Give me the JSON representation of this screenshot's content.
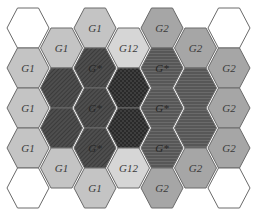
{
  "diagram": {
    "colors": {
      "white": "#ffffff",
      "G1": "#c4c4c4",
      "G12": "#d6d6d6",
      "G2": "#a6a6a6",
      "dark_diag": "#4a4a4a",
      "dark_cross": "#3a3a3a",
      "dark_horiz": "#5c5c5c",
      "stroke": "#6a6a6a"
    },
    "cells": [
      {
        "col": 1,
        "row": 0,
        "type": "white",
        "label": ""
      },
      {
        "col": 1,
        "row": 1,
        "type": "G1",
        "label": "G1"
      },
      {
        "col": 1,
        "row": 2,
        "type": "G1",
        "label": "G1"
      },
      {
        "col": 1,
        "row": 3,
        "type": "G1",
        "label": "G1"
      },
      {
        "col": 1,
        "row": 4,
        "type": "white",
        "label": ""
      },
      {
        "col": 2,
        "row": 0,
        "type": "G1",
        "label": "G1"
      },
      {
        "col": 2,
        "row": 1,
        "type": "dark_diag",
        "label": ""
      },
      {
        "col": 2,
        "row": 2,
        "type": "dark_diag",
        "label": ""
      },
      {
        "col": 2,
        "row": 3,
        "type": "G1",
        "label": "G1"
      },
      {
        "col": 3,
        "row": 0,
        "type": "G1",
        "label": "G1"
      },
      {
        "col": 3,
        "row": 1,
        "type": "dark_diag",
        "label": "G*"
      },
      {
        "col": 3,
        "row": 2,
        "type": "dark_diag",
        "label": "G*"
      },
      {
        "col": 3,
        "row": 3,
        "type": "dark_diag",
        "label": "G*"
      },
      {
        "col": 3,
        "row": 4,
        "type": "G1",
        "label": "G1"
      },
      {
        "col": 4,
        "row": 0,
        "type": "G12",
        "label": "G12"
      },
      {
        "col": 4,
        "row": 1,
        "type": "dark_cross",
        "label": ""
      },
      {
        "col": 4,
        "row": 2,
        "type": "dark_cross",
        "label": ""
      },
      {
        "col": 4,
        "row": 3,
        "type": "G12",
        "label": "G12"
      },
      {
        "col": 5,
        "row": 0,
        "type": "G2",
        "label": "G2"
      },
      {
        "col": 5,
        "row": 1,
        "type": "dark_horiz",
        "label": "G*"
      },
      {
        "col": 5,
        "row": 2,
        "type": "dark_horiz",
        "label": "G*"
      },
      {
        "col": 5,
        "row": 3,
        "type": "dark_horiz",
        "label": "G*"
      },
      {
        "col": 5,
        "row": 4,
        "type": "G2",
        "label": "G2"
      },
      {
        "col": 6,
        "row": 0,
        "type": "G2",
        "label": "G2"
      },
      {
        "col": 6,
        "row": 1,
        "type": "dark_horiz",
        "label": ""
      },
      {
        "col": 6,
        "row": 2,
        "type": "dark_horiz",
        "label": ""
      },
      {
        "col": 6,
        "row": 3,
        "type": "G2",
        "label": "G2"
      },
      {
        "col": 7,
        "row": 0,
        "type": "white",
        "label": ""
      },
      {
        "col": 7,
        "row": 1,
        "type": "G2",
        "label": "G2"
      },
      {
        "col": 7,
        "row": 2,
        "type": "G2",
        "label": "G2"
      },
      {
        "col": 7,
        "row": 3,
        "type": "G2",
        "label": "G2"
      },
      {
        "col": 7,
        "row": 4,
        "type": "white",
        "label": ""
      }
    ]
  }
}
